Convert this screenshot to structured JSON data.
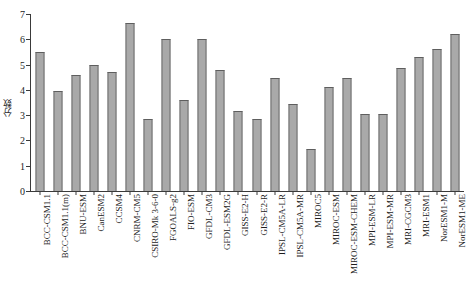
{
  "chart_data": {
    "type": "bar",
    "title": "",
    "xlabel": "",
    "ylabel": "分数",
    "ylim": [
      0,
      7
    ],
    "yticks": [
      0,
      1,
      2,
      3,
      4,
      5,
      6,
      7
    ],
    "ytick_labels": [
      "0",
      "1",
      "2",
      "3",
      "4",
      "5",
      "6",
      "7"
    ],
    "grid": false,
    "legend": false,
    "bar_color": "#a9a9a9",
    "bar_edge_color": "#6f6f6f",
    "axis_color": "#3a3a3a",
    "categories": [
      "BCC-CSM1.1",
      "BCC-CSM1.1(m)",
      "BNU-ESM",
      "CanESM2",
      "CCSM4",
      "CNRM-CM5",
      "CSIRO-Mk 3-6-0",
      "FGOALS-g2",
      "FIO-ESM",
      "GFDL-CM3",
      "GFDL-ESM2G",
      "GISS-E2-H",
      "GISS-E2-R",
      "IPSL-CM5A-LR",
      "IPSL-CM5A-MR",
      "MIROC5",
      "MIROC-ESM",
      "MIROC-ESM-CHEM",
      "MPI-ESM-LR",
      "MPI-ESM-MR",
      "MRI-CGCM3",
      "MRI-ESM1",
      "NorESM1-M",
      "NorESM1-ME"
    ],
    "values": [
      5.5,
      3.95,
      4.6,
      5.0,
      4.7,
      6.65,
      2.85,
      6.0,
      3.6,
      6.0,
      4.8,
      3.18,
      2.85,
      4.45,
      3.45,
      1.65,
      4.1,
      4.45,
      3.05,
      3.05,
      4.85,
      5.3,
      5.6,
      6.2
    ]
  }
}
